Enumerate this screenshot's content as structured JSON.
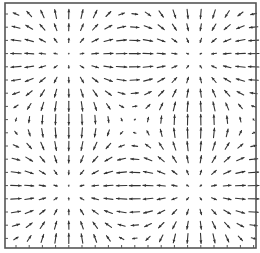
{
  "chart_data": {
    "type": "quiver",
    "title": "",
    "xlabel": "",
    "ylabel": "",
    "grid": false,
    "legend": null,
    "plot_area_px": {
      "left": 5,
      "top": 3,
      "right": 256,
      "bottom": 248
    },
    "arrow_grid": {
      "x_start": 16,
      "x_step": 13.2,
      "cols": 19,
      "y_start": 14,
      "y_step": 13.2,
      "rows": 18
    },
    "field": {
      "potential": "cos(kx*(x-x0))*cos(ky*(y-y0)), velocity = -grad",
      "x0": 68,
      "y0": 57,
      "half_period_x": 127,
      "half_period_y": 133,
      "max_arrow_len": 11
    },
    "critical_points": [
      {
        "type": "source",
        "x": 68,
        "y": 57
      },
      {
        "type": "sink",
        "x": 195,
        "y": 57
      },
      {
        "type": "sink",
        "x": 68,
        "y": 190
      },
      {
        "type": "source",
        "x": 195,
        "y": 190
      }
    ],
    "colors": {
      "arrow": "#333333",
      "frame": "#555555",
      "background": "#ffffff"
    }
  }
}
